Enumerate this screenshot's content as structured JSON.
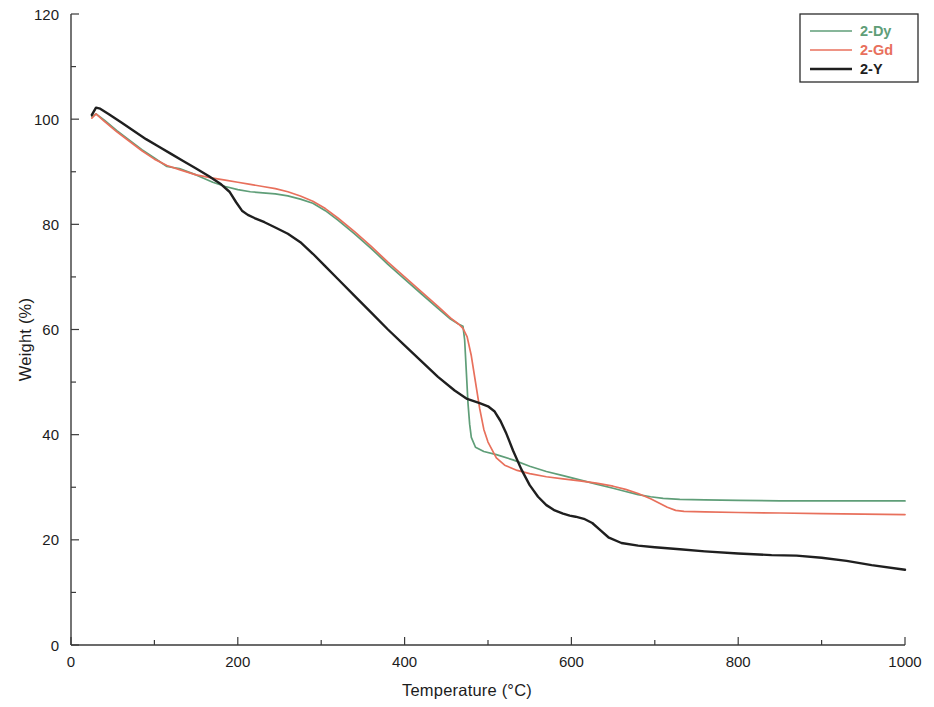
{
  "chart_data": {
    "type": "line",
    "title": "",
    "xlabel": "Temperature (°C)",
    "ylabel": "Weight (%)",
    "xlim": [
      0,
      1000
    ],
    "ylim": [
      0,
      120
    ],
    "xticks": [
      0,
      200,
      400,
      600,
      800,
      1000
    ],
    "yticks": [
      0,
      20,
      40,
      60,
      80,
      100,
      120
    ],
    "x_minor_step": 100,
    "y_minor_step": 10,
    "grid": false,
    "legend_position": "top-right",
    "series": [
      {
        "name": "2-Dy",
        "color": "#5f9e78",
        "x": [
          25,
          30,
          40,
          55,
          70,
          85,
          100,
          115,
          130,
          150,
          170,
          185,
          200,
          215,
          230,
          245,
          260,
          275,
          290,
          305,
          320,
          340,
          360,
          380,
          400,
          420,
          440,
          455,
          465,
          470,
          472,
          474,
          476,
          478,
          480,
          485,
          495,
          510,
          530,
          550,
          570,
          590,
          610,
          630,
          650,
          665,
          680,
          695,
          710,
          730,
          760,
          800,
          850,
          900,
          950,
          1000
        ],
        "y": [
          100.5,
          101.0,
          99.8,
          97.8,
          96.0,
          94.2,
          92.6,
          91.0,
          90.6,
          89.4,
          88.0,
          87.2,
          86.6,
          86.2,
          86.0,
          85.8,
          85.4,
          84.8,
          84.0,
          82.6,
          80.8,
          78.2,
          75.4,
          72.4,
          69.6,
          66.8,
          64.0,
          62.0,
          61.0,
          60.6,
          58.0,
          52.0,
          46.0,
          42.0,
          39.5,
          37.6,
          36.8,
          36.2,
          35.2,
          34.0,
          33.0,
          32.2,
          31.4,
          30.6,
          29.8,
          29.2,
          28.6,
          28.2,
          27.9,
          27.7,
          27.6,
          27.5,
          27.4,
          27.4,
          27.4,
          27.4
        ]
      },
      {
        "name": "2-Gd",
        "color": "#e8705c",
        "x": [
          25,
          30,
          40,
          55,
          70,
          85,
          100,
          115,
          130,
          150,
          170,
          185,
          200,
          215,
          230,
          245,
          260,
          275,
          290,
          305,
          320,
          340,
          360,
          380,
          400,
          420,
          440,
          455,
          465,
          470,
          475,
          480,
          485,
          490,
          495,
          500,
          510,
          520,
          535,
          550,
          570,
          590,
          610,
          630,
          650,
          665,
          680,
          695,
          705,
          715,
          725,
          735,
          760,
          800,
          850,
          900,
          950,
          1000
        ],
        "y": [
          100.2,
          101.0,
          99.6,
          97.6,
          95.8,
          94.0,
          92.4,
          91.2,
          90.4,
          89.4,
          88.8,
          88.4,
          88.0,
          87.6,
          87.2,
          86.8,
          86.2,
          85.4,
          84.4,
          83.0,
          81.2,
          78.6,
          75.8,
          72.8,
          70.0,
          67.2,
          64.4,
          62.2,
          61.0,
          60.2,
          58.6,
          55.0,
          50.0,
          45.0,
          41.0,
          38.6,
          35.6,
          34.2,
          33.2,
          32.6,
          32.0,
          31.6,
          31.2,
          30.8,
          30.2,
          29.6,
          28.8,
          27.8,
          27.0,
          26.2,
          25.6,
          25.4,
          25.3,
          25.2,
          25.1,
          25.0,
          24.9,
          24.8
        ]
      },
      {
        "name": "2-Y",
        "color": "#1f1f1f",
        "x": [
          25,
          30,
          35,
          45,
          60,
          75,
          90,
          105,
          120,
          135,
          150,
          165,
          180,
          190,
          198,
          205,
          212,
          220,
          232,
          245,
          260,
          275,
          290,
          305,
          320,
          340,
          360,
          380,
          400,
          420,
          440,
          460,
          475,
          490,
          500,
          508,
          515,
          522,
          530,
          540,
          550,
          560,
          570,
          580,
          590,
          598,
          605,
          615,
          625,
          635,
          645,
          660,
          680,
          700,
          730,
          760,
          800,
          840,
          870,
          900,
          930,
          960,
          1000
        ],
        "y": [
          100.8,
          102.2,
          102.0,
          101.0,
          99.4,
          97.8,
          96.2,
          94.8,
          93.4,
          92.0,
          90.6,
          89.2,
          87.6,
          86.2,
          84.2,
          82.6,
          81.8,
          81.2,
          80.4,
          79.4,
          78.2,
          76.6,
          74.4,
          72.0,
          69.6,
          66.4,
          63.2,
          60.0,
          57.0,
          54.0,
          51.0,
          48.4,
          46.8,
          46.0,
          45.4,
          44.4,
          42.6,
          40.2,
          37.0,
          33.4,
          30.4,
          28.2,
          26.6,
          25.6,
          25.0,
          24.6,
          24.4,
          24.0,
          23.2,
          21.8,
          20.4,
          19.4,
          18.9,
          18.6,
          18.2,
          17.8,
          17.4,
          17.1,
          17.0,
          16.6,
          16.0,
          15.2,
          14.3
        ]
      }
    ]
  },
  "legend": {
    "entries": [
      {
        "label": "2-Dy",
        "color": "#5f9e78"
      },
      {
        "label": "2-Gd",
        "color": "#e8705c"
      },
      {
        "label": "2-Y",
        "color": "#1f1f1f"
      }
    ]
  },
  "axes": {
    "x_title": "Temperature (°C)",
    "y_title": "Weight (%)"
  }
}
